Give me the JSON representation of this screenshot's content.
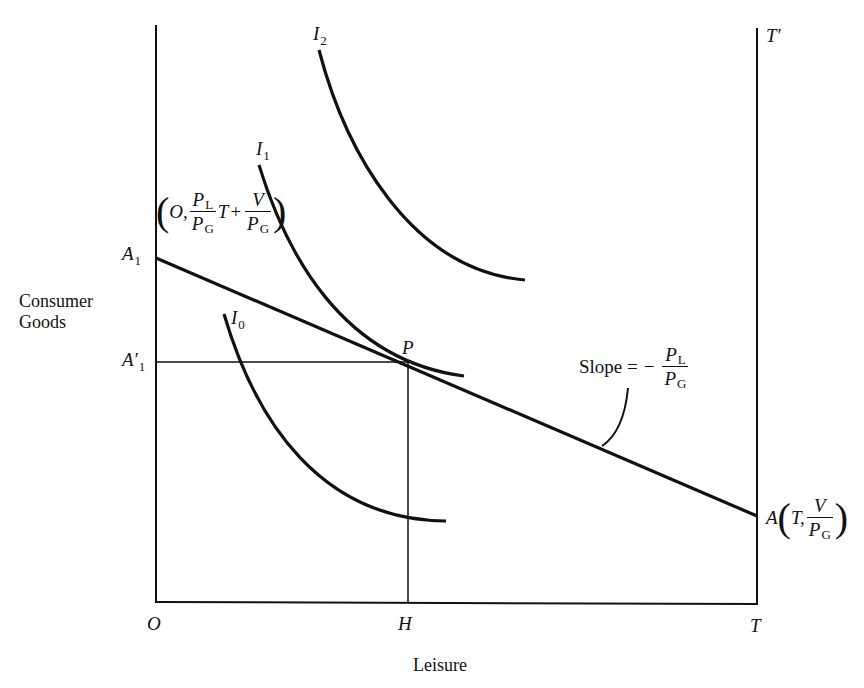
{
  "figure": {
    "x_axis_label": "Leisure",
    "y_axis_label_line1": "Consumer",
    "y_axis_label_line2": "Goods",
    "origin_label": "O",
    "h_label": "H",
    "t_label": "T",
    "t_prime_label": "T′",
    "a1_label": "A",
    "a1_sub": "1",
    "a1_prime_label": "A′",
    "a1_prime_sub": "1",
    "p_label": "P",
    "a_label": "A",
    "curves": [
      {
        "name": "I",
        "sub": "0"
      },
      {
        "name": "I",
        "sub": "1"
      },
      {
        "name": "I",
        "sub": "2"
      }
    ],
    "a1_coord": {
      "open": "(",
      "first": "O,",
      "frac1_num": "P",
      "frac1_num_sub": "L",
      "frac1_den": "P",
      "frac1_den_sub": "G",
      "t": "T",
      "plus": "+",
      "frac2_num": "V",
      "frac2_den": "P",
      "frac2_den_sub": "G",
      "close": ")"
    },
    "a_coord": {
      "open": "(",
      "first": "T,",
      "frac_num": "V",
      "frac_den": "P",
      "frac_den_sub": "G",
      "close": ")"
    },
    "slope": {
      "text": "Slope =",
      "minus": "−",
      "num": "P",
      "num_sub": "L",
      "den": "P",
      "den_sub": "G"
    },
    "line_color": "#111111",
    "background": "#ffffff"
  }
}
